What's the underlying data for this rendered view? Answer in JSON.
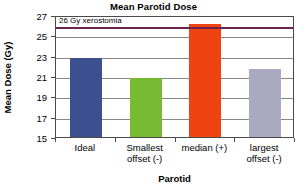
{
  "chart_data": {
    "type": "bar",
    "title": "Mean Parotid Dose",
    "xlabel": "Parotid",
    "ylabel": "Mean Dose (Gy)",
    "categories": [
      "Ideal",
      "Smallest offset (-)",
      "median (+)",
      "largest offset (-)"
    ],
    "category_lines": [
      [
        "Ideal",
        ""
      ],
      [
        "Smallest",
        "offset (-)"
      ],
      [
        "median (+)",
        ""
      ],
      [
        "largest",
        "offset (-)"
      ]
    ],
    "values": [
      22.8,
      20.8,
      26.1,
      21.7
    ],
    "bar_colors": [
      "#3c4f8f",
      "#77bb33",
      "#ef4411",
      "#a9a9c0"
    ],
    "ylim": [
      15,
      27
    ],
    "yticks": [
      15,
      17,
      19,
      21,
      23,
      25,
      27
    ],
    "ytick_labels": [
      "15",
      "17",
      "19",
      "21",
      "23",
      "25",
      "27"
    ],
    "grid": true,
    "legend": "none",
    "annotations": [
      {
        "name": "xerostomia-threshold",
        "label": "26 Gy xerostomia",
        "value": 26,
        "color": "#6b2450"
      }
    ]
  }
}
